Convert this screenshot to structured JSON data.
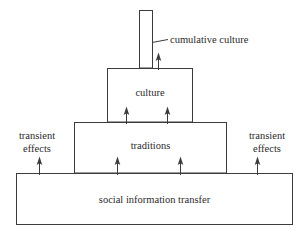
{
  "diagram": {
    "stroke_color": "#3c3c3c",
    "background_color": "#ffffff",
    "labels": {
      "cumulative_culture": "cumulative culture",
      "culture": "culture",
      "traditions": "traditions",
      "social_information_transfer": "social information transfer",
      "transient_effects_left_line1": "transient",
      "transient_effects_left_line2": "effects",
      "transient_effects_right_line1": "transient",
      "transient_effects_right_line2": "effects"
    },
    "boxes": [
      {
        "name": "cumulative-culture-column",
        "x": 139,
        "y": 10,
        "width": 14,
        "height": 58
      },
      {
        "name": "culture-box",
        "x": 107,
        "y": 68,
        "width": 86,
        "height": 54
      },
      {
        "name": "traditions-box",
        "x": 74,
        "y": 122,
        "width": 153,
        "height": 51
      },
      {
        "name": "social-information-transfer-box",
        "x": 16,
        "y": 173,
        "width": 277,
        "height": 52
      }
    ],
    "arrows": [
      {
        "name": "arrow-into-cumulative-culture",
        "x": 158,
        "y_bottom": 70,
        "y_top": 54
      },
      {
        "name": "arrow-traditions-to-culture-left",
        "x": 126,
        "y_bottom": 124,
        "y_top": 107
      },
      {
        "name": "arrow-traditions-to-culture-right",
        "x": 167,
        "y_bottom": 124,
        "y_top": 107
      },
      {
        "name": "arrow-base-to-traditions-left",
        "x": 117,
        "y_bottom": 175,
        "y_top": 157
      },
      {
        "name": "arrow-base-to-traditions-right",
        "x": 180,
        "y_bottom": 175,
        "y_top": 157
      },
      {
        "name": "arrow-transient-effects-left",
        "x": 39,
        "y_bottom": 175,
        "y_top": 157
      },
      {
        "name": "arrow-transient-effects-right",
        "x": 257,
        "y_bottom": 175,
        "y_top": 157
      }
    ],
    "leader_line": {
      "name": "cumulative-culture-leader",
      "x1": 152,
      "y1": 42,
      "x2": 168,
      "y2": 39
    }
  }
}
